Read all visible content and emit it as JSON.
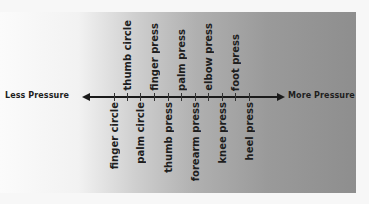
{
  "diagram": {
    "axis": {
      "left_label": "Less Pressure",
      "right_label": "More Pressure"
    },
    "labels_top": [
      {
        "text": "thumb circle",
        "x": 127
      },
      {
        "text": "finger press",
        "x": 154
      },
      {
        "text": "palm press",
        "x": 181
      },
      {
        "text": "elbow press",
        "x": 208
      },
      {
        "text": "foot press",
        "x": 235
      }
    ],
    "labels_bottom": [
      {
        "text": "finger circle",
        "x": 114
      },
      {
        "text": "palm circle",
        "x": 140
      },
      {
        "text": "thumb press",
        "x": 168
      },
      {
        "text": "forearm press",
        "x": 195
      },
      {
        "text": "knee press",
        "x": 222
      },
      {
        "text": "heel press",
        "x": 249
      }
    ],
    "order_less_to_more": [
      "finger circle",
      "thumb circle",
      "palm circle",
      "finger press",
      "thumb press",
      "palm press",
      "forearm press",
      "elbow press",
      "knee press",
      "foot press",
      "heel press"
    ],
    "colors": {
      "gradient_start": "#fbfbfb",
      "gradient_end": "#8e8e8e",
      "ink": "#1a1a1a"
    }
  }
}
